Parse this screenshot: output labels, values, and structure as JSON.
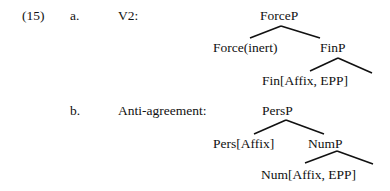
{
  "example": {
    "number": "(15)",
    "items": [
      {
        "letter": "a.",
        "label": "V2:",
        "tree": {
          "root": "ForceP",
          "left": "Force(inert)",
          "right": "FinP",
          "right_left": "Fin[Affix, EPP]"
        }
      },
      {
        "letter": "b.",
        "label": "Anti-agreement:",
        "tree": {
          "root": "PersP",
          "left": "Pers[Affix]",
          "right": "NumP",
          "right_left": "Num[Affix, EPP]"
        }
      }
    ]
  }
}
